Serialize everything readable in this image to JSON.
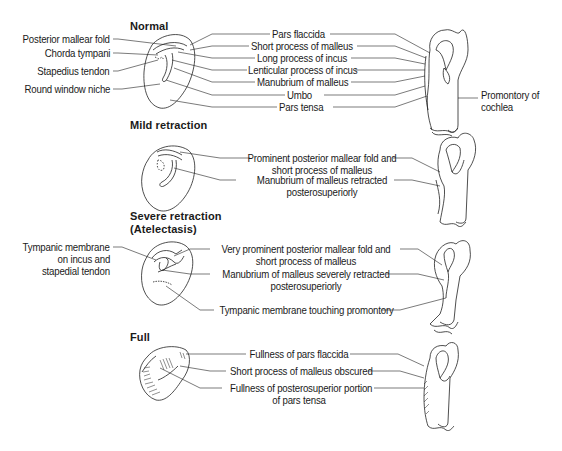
{
  "sections": [
    {
      "heading": "Normal",
      "left_labels": [
        "Posterior mallear fold",
        "Chorda tympani",
        "Stapedius tendon",
        "Round window niche"
      ],
      "center_labels": [
        "Pars flaccida",
        "Short process of malleus",
        "Long process of incus",
        "Lenticular process of incus",
        "Manubrium of malleus",
        "Umbo",
        "Pars tensa"
      ],
      "right_label_line1": "Promontory of",
      "right_label_line2": "cochlea"
    },
    {
      "heading": "Mild retraction",
      "center_labels": [
        {
          "line1": "Prominent posterior mallear fold and",
          "line2": "short process of malleus"
        },
        {
          "line1": "Manubrium of malleus retracted",
          "line2": "posterosuperiorly"
        }
      ]
    },
    {
      "heading_line1": "Severe retraction",
      "heading_line2": "(Atelectasis)",
      "left_label": {
        "line1": "Tympanic membrane",
        "line2": "on incus and",
        "line3": "stapedial tendon"
      },
      "center_labels": [
        {
          "line1": "Very prominent posterior mallear fold and",
          "line2": "short process of malleus"
        },
        {
          "line1": "Manubrium of malleus severely retracted",
          "line2": "posterosuperiorly"
        },
        {
          "line1": "Tympanic membrane touching promontory"
        }
      ]
    },
    {
      "heading": "Full",
      "center_labels": [
        {
          "line1": "Fullness of pars flaccida"
        },
        {
          "line1": "Short process of malleus obscured"
        },
        {
          "line1": "Fullness of posterosuperior portion",
          "line2": "of pars tensa"
        }
      ]
    }
  ]
}
